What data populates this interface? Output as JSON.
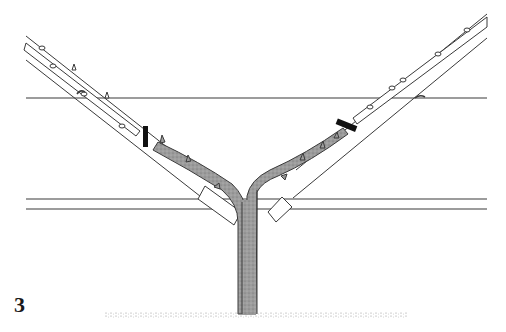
{
  "figure": {
    "number": "3",
    "colors": {
      "line": "#3a3a3a",
      "wood_fill": "#9a9a9a",
      "cane_fill": "#ffffff",
      "cut_mark": "#111111",
      "ground": "#8c8c8c"
    }
  }
}
